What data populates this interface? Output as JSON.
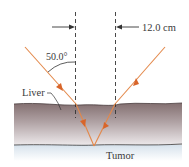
{
  "figure": {
    "dimension_label": "12.0 cm",
    "angle_label": "50.0°",
    "tissue_label": "Liver",
    "target_label": "Tumor"
  },
  "colors": {
    "ray": "#e07a3a",
    "arrowhead": "#d8652a",
    "tissue_top": "#8a7676",
    "tissue_bottom": "#e8e4e6",
    "glow": "#dfe8f0",
    "dashed_line": "#333333",
    "text": "#3a3a3a"
  },
  "geometry": {
    "separation_cm": 12.0,
    "incidence_angle_deg": 50.0
  }
}
